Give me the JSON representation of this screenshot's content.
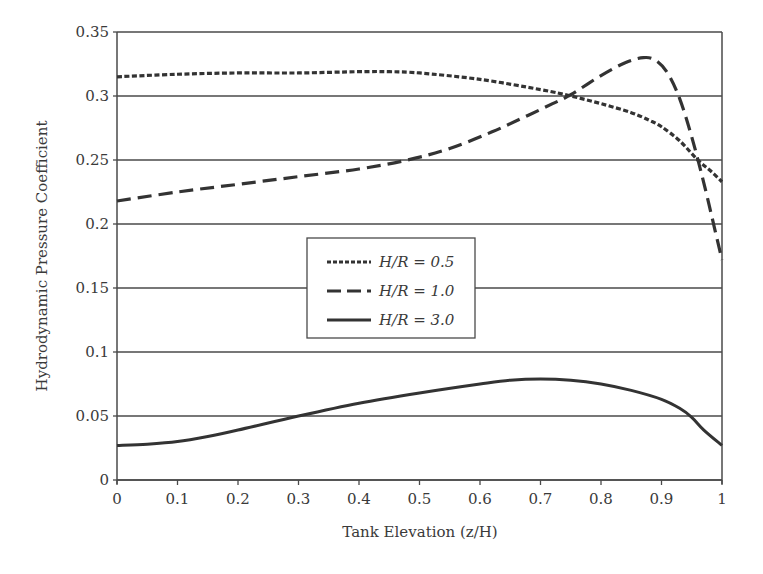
{
  "chart_data": {
    "type": "line",
    "title": "",
    "xlabel": "Tank Elevation (z/H)",
    "ylabel": "Hydrodynamic Pressure Coefficient",
    "xlim": [
      0,
      1
    ],
    "ylim": [
      0,
      0.35
    ],
    "xticks": [
      "0",
      "0.1",
      "0.2",
      "0.3",
      "0.4",
      "0.5",
      "0.6",
      "0.7",
      "0.8",
      "0.9",
      "1"
    ],
    "yticks": [
      "0",
      "0.05",
      "0.1",
      "0.15",
      "0.2",
      "0.25",
      "0.3",
      "0.35"
    ],
    "grid": "horizontal",
    "legend_position": "center",
    "series": [
      {
        "name": "H/R = 0.5",
        "style": "dotted",
        "x": [
          0,
          0.1,
          0.2,
          0.3,
          0.4,
          0.45,
          0.5,
          0.6,
          0.7,
          0.75,
          0.8,
          0.85,
          0.88,
          0.9,
          0.93,
          0.96,
          0.98,
          1.0
        ],
        "y": [
          0.315,
          0.317,
          0.318,
          0.318,
          0.319,
          0.319,
          0.318,
          0.313,
          0.305,
          0.3,
          0.294,
          0.287,
          0.281,
          0.276,
          0.265,
          0.25,
          0.242,
          0.233
        ]
      },
      {
        "name": "H/R = 1.0",
        "style": "dashed",
        "x": [
          0,
          0.1,
          0.2,
          0.3,
          0.4,
          0.48,
          0.55,
          0.62,
          0.68,
          0.72,
          0.75,
          0.8,
          0.84,
          0.87,
          0.89,
          0.91,
          0.93,
          0.95,
          0.97,
          0.99,
          1.0
        ],
        "y": [
          0.218,
          0.225,
          0.231,
          0.237,
          0.243,
          0.25,
          0.259,
          0.272,
          0.285,
          0.294,
          0.301,
          0.316,
          0.326,
          0.33,
          0.328,
          0.318,
          0.298,
          0.268,
          0.232,
          0.192,
          0.172
        ]
      },
      {
        "name": "H/R = 3.0",
        "style": "solid",
        "x": [
          0,
          0.05,
          0.1,
          0.15,
          0.2,
          0.3,
          0.4,
          0.5,
          0.6,
          0.65,
          0.7,
          0.75,
          0.8,
          0.85,
          0.9,
          0.93,
          0.95,
          0.97,
          1.0
        ],
        "y": [
          0.027,
          0.028,
          0.03,
          0.034,
          0.039,
          0.05,
          0.06,
          0.068,
          0.075,
          0.078,
          0.079,
          0.078,
          0.075,
          0.07,
          0.063,
          0.056,
          0.049,
          0.039,
          0.027
        ]
      }
    ]
  },
  "legend": {
    "items": [
      {
        "label": "H/R = 0.5",
        "style": "dotted"
      },
      {
        "label": "H/R = 1.0",
        "style": "dashed"
      },
      {
        "label": "H/R = 3.0",
        "style": "solid"
      }
    ]
  },
  "colors": {
    "line": "#333333",
    "grid": "#4a4a4a",
    "text": "#3a3a3a"
  }
}
